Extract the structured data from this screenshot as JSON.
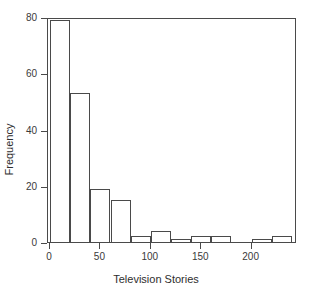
{
  "chart_data": {
    "type": "bar",
    "title": "",
    "subtitle": "",
    "xlabel": "Television Stories",
    "ylabel": "Frequency",
    "xlim": [
      -2,
      245
    ],
    "ylim": [
      0,
      80
    ],
    "grid": false,
    "legend": null,
    "bin_width": 20,
    "bin_edges": [
      0,
      20,
      40,
      60,
      80,
      100,
      120,
      140,
      160,
      180,
      200,
      220,
      240
    ],
    "categories": [
      "0-20",
      "20-40",
      "40-60",
      "60-80",
      "80-100",
      "100-120",
      "120-140",
      "140-160",
      "160-180",
      "180-200",
      "200-220",
      "220-240"
    ],
    "values": [
      79,
      53,
      19,
      15,
      2,
      4,
      1,
      2,
      2,
      0,
      1,
      2
    ],
    "bars": [
      {
        "left": 0,
        "right": 20,
        "value": 79
      },
      {
        "left": 20,
        "right": 40,
        "value": 53
      },
      {
        "left": 40,
        "right": 60,
        "value": 19
      },
      {
        "left": 60,
        "right": 80,
        "value": 15
      },
      {
        "left": 80,
        "right": 100,
        "value": 2
      },
      {
        "left": 100,
        "right": 120,
        "value": 4
      },
      {
        "left": 120,
        "right": 140,
        "value": 1
      },
      {
        "left": 140,
        "right": 160,
        "value": 2
      },
      {
        "left": 160,
        "right": 180,
        "value": 2
      },
      {
        "left": 180,
        "right": 200,
        "value": 0
      },
      {
        "left": 200,
        "right": 220,
        "value": 1
      },
      {
        "left": 220,
        "right": 240,
        "value": 2
      }
    ],
    "xticks": [
      0,
      50,
      100,
      150,
      200
    ],
    "xtick_labels": [
      "0",
      "50",
      "100",
      "150",
      "200"
    ],
    "yticks": [
      0,
      20,
      40,
      60,
      80
    ],
    "ytick_labels": [
      "0",
      "20",
      "40",
      "60",
      "80"
    ],
    "colors": {
      "bar_edge": "#4a4a4a",
      "bar_fill": "transparent",
      "axis": "#4a4a4a",
      "text": "#2e2e2e",
      "background": "#ffffff"
    }
  }
}
